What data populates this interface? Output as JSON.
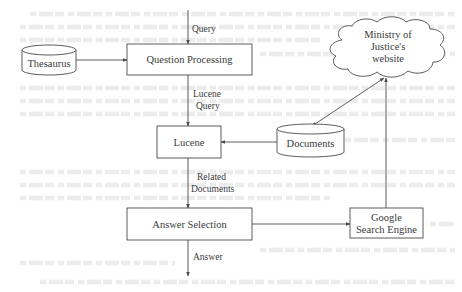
{
  "diagram": {
    "nodes": {
      "thesaurus": {
        "label": "Thesaurus",
        "shape": "cylinder"
      },
      "question_processing": {
        "label": "Question Processing",
        "shape": "rectangle"
      },
      "lucene": {
        "label": "Lucene",
        "shape": "rectangle"
      },
      "documents": {
        "label": "Documents",
        "shape": "cylinder"
      },
      "answer_selection": {
        "label": "Answer Selection",
        "shape": "rectangle"
      },
      "ministry_website": {
        "label_lines": [
          "Ministry of",
          "Justice's",
          "website"
        ],
        "shape": "cloud"
      },
      "google": {
        "label_lines": [
          "Google",
          "Search Engine"
        ],
        "shape": "rectangle"
      }
    },
    "edges": [
      {
        "from": "input",
        "to": "question_processing",
        "label_lines": [
          "Query"
        ]
      },
      {
        "from": "thesaurus",
        "to": "question_processing",
        "label_lines": []
      },
      {
        "from": "question_processing",
        "to": "lucene",
        "label_lines": [
          "Lucene",
          "Query"
        ]
      },
      {
        "from": "documents",
        "to": "lucene",
        "label_lines": []
      },
      {
        "from": "lucene",
        "to": "answer_selection",
        "label_lines": [
          "Related",
          "Documents"
        ]
      },
      {
        "from": "answer_selection",
        "to": "output",
        "label_lines": [
          "Answer"
        ]
      },
      {
        "from": "answer_selection",
        "to": "google",
        "label_lines": []
      },
      {
        "from": "google",
        "to": "ministry_website",
        "label_lines": []
      },
      {
        "from": "ministry_website",
        "to": "documents",
        "label_lines": [],
        "bidirectional": true
      }
    ],
    "colors": {
      "stroke": "#4a4a4a",
      "text": "#3a3a3a",
      "background": "#ffffff"
    }
  }
}
